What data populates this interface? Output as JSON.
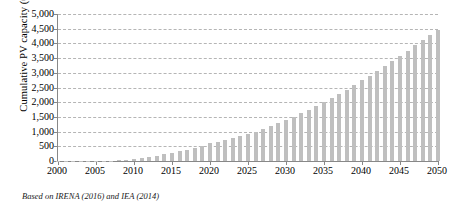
{
  "chart_data": {
    "type": "bar",
    "title": "",
    "subtitle": "",
    "xlabel": "",
    "ylabel": "Cumulative PV capacity (GW)",
    "xlim": [
      2000,
      2050
    ],
    "ylim": [
      0,
      5000
    ],
    "grid": true,
    "legend": null,
    "y_ticks": [
      "5,000",
      "4,500",
      "4,000",
      "3,500",
      "3,000",
      "2,500",
      "2,000",
      "1,500",
      "1,000",
      "500",
      "0"
    ],
    "y_tick_values": [
      5000,
      4500,
      4000,
      3500,
      3000,
      2500,
      2000,
      1500,
      1000,
      500,
      0
    ],
    "x_ticks": [
      "2000",
      "2005",
      "2010",
      "2015",
      "2020",
      "2025",
      "2030",
      "2035",
      "2040",
      "2045",
      "2050"
    ],
    "x_tick_values": [
      2000,
      2005,
      2010,
      2015,
      2020,
      2025,
      2030,
      2035,
      2040,
      2045,
      2050
    ],
    "bar_color": "#bfbfbf",
    "grid_color": "#b5b5b5",
    "axis_color": "#888888",
    "categories": [
      2000,
      2001,
      2002,
      2003,
      2004,
      2005,
      2006,
      2007,
      2008,
      2009,
      2010,
      2011,
      2012,
      2013,
      2014,
      2015,
      2016,
      2017,
      2018,
      2019,
      2020,
      2021,
      2022,
      2023,
      2024,
      2025,
      2026,
      2027,
      2028,
      2029,
      2030,
      2031,
      2032,
      2033,
      2034,
      2035,
      2036,
      2037,
      2038,
      2039,
      2040,
      2041,
      2042,
      2043,
      2044,
      2045,
      2046,
      2047,
      2048,
      2049,
      2050
    ],
    "values": [
      1,
      2,
      3,
      4,
      6,
      8,
      11,
      16,
      23,
      40,
      70,
      100,
      140,
      180,
      230,
      280,
      330,
      390,
      450,
      520,
      600,
      660,
      720,
      780,
      840,
      910,
      1000,
      1090,
      1180,
      1280,
      1390,
      1500,
      1620,
      1740,
      1870,
      2000,
      2140,
      2280,
      2430,
      2580,
      2740,
      2900,
      3060,
      3230,
      3400,
      3570,
      3750,
      3930,
      4100,
      4280,
      4450
    ]
  },
  "footnote": {
    "text": "Based on IRENA (2016) and IEA (2014)"
  }
}
